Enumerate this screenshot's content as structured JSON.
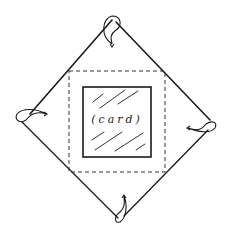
{
  "diagram": {
    "title": "",
    "card": {
      "label": "(card)"
    },
    "colors": {
      "line": "#1a1a1a",
      "background": "#ffffff"
    },
    "envelope": {
      "tips": {
        "top": [
          112,
          18
        ],
        "right": [
          214,
          124
        ],
        "bottom": [
          120,
          222
        ],
        "left": [
          18,
          117
        ]
      }
    },
    "folds": [
      "top-flap",
      "right-flap",
      "bottom-flap",
      "left-flap"
    ]
  }
}
